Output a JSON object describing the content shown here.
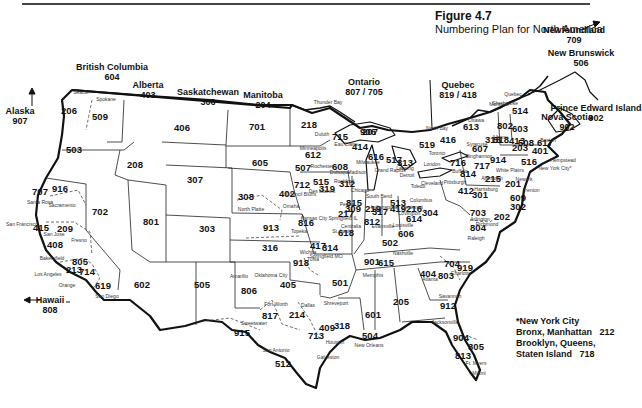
{
  "figure": {
    "title": "Figure 4.7",
    "subtitle": "Numbering Plan for North America"
  },
  "regions": [
    {
      "name": "Alaska",
      "code": "907",
      "x": 20,
      "y": 116
    },
    {
      "name": "British Columbia",
      "code": "604",
      "x": 112,
      "y": 72
    },
    {
      "name": "Alberta",
      "code": "403",
      "x": 148,
      "y": 90
    },
    {
      "name": "Saskatchewan",
      "code": "306",
      "x": 208,
      "y": 97
    },
    {
      "name": "Manitoba",
      "code": "204",
      "x": 263,
      "y": 100
    },
    {
      "name": "Ontario",
      "code": "807 / 705",
      "x": 364,
      "y": 87
    },
    {
      "name": "Quebec",
      "code": "819 / 418",
      "x": 458,
      "y": 90
    },
    {
      "name": "Newfoundland",
      "code": "709",
      "x": 574,
      "y": 35
    },
    {
      "name": "New Brunswick",
      "code": "506",
      "x": 581,
      "y": 58
    },
    {
      "name": "Nova Scotia",
      "code": "902",
      "x": 567,
      "y": 122
    },
    {
      "name": "Prince Edward Island",
      "code": "902",
      "x": 596,
      "y": 113
    },
    {
      "name": "Hawaii",
      "code": "808",
      "x": 50,
      "y": 305
    }
  ],
  "area_codes": [
    {
      "code": "206",
      "x": 69,
      "y": 111
    },
    {
      "code": "509",
      "x": 100,
      "y": 117
    },
    {
      "code": "503",
      "x": 74,
      "y": 150
    },
    {
      "code": "208",
      "x": 135,
      "y": 165
    },
    {
      "code": "406",
      "x": 182,
      "y": 128
    },
    {
      "code": "307",
      "x": 195,
      "y": 180
    },
    {
      "code": "701",
      "x": 257,
      "y": 127
    },
    {
      "code": "605",
      "x": 260,
      "y": 163
    },
    {
      "code": "218",
      "x": 309,
      "y": 125
    },
    {
      "code": "707",
      "x": 40,
      "y": 192
    },
    {
      "code": "916",
      "x": 60,
      "y": 189
    },
    {
      "code": "702",
      "x": 100,
      "y": 212
    },
    {
      "code": "801",
      "x": 151,
      "y": 222
    },
    {
      "code": "303",
      "x": 207,
      "y": 229
    },
    {
      "code": "308",
      "x": 246,
      "y": 197
    },
    {
      "code": "402",
      "x": 287,
      "y": 194
    },
    {
      "code": "712",
      "x": 302,
      "y": 185
    },
    {
      "code": "515",
      "x": 321,
      "y": 182
    },
    {
      "code": "612",
      "x": 313,
      "y": 155
    },
    {
      "code": "507",
      "x": 303,
      "y": 168
    },
    {
      "code": "715",
      "x": 340,
      "y": 137
    },
    {
      "code": "906",
      "x": 368,
      "y": 132
    },
    {
      "code": "414",
      "x": 360,
      "y": 147
    },
    {
      "code": "608",
      "x": 340,
      "y": 167
    },
    {
      "code": "616",
      "x": 376,
      "y": 157
    },
    {
      "code": "517",
      "x": 394,
      "y": 160
    },
    {
      "code": "313",
      "x": 405,
      "y": 163
    },
    {
      "code": "519",
      "x": 427,
      "y": 145
    },
    {
      "code": "416",
      "x": 448,
      "y": 140
    },
    {
      "code": "613",
      "x": 471,
      "y": 127
    },
    {
      "code": "514",
      "x": 520,
      "y": 111
    },
    {
      "code": "207",
      "x": 370,
      "y": 132
    },
    {
      "code": "315",
      "x": 493,
      "y": 140
    },
    {
      "code": "518",
      "x": 501,
      "y": 140
    },
    {
      "code": "802",
      "x": 505,
      "y": 126
    },
    {
      "code": "603",
      "x": 520,
      "y": 129
    },
    {
      "code": "413",
      "x": 517,
      "y": 141
    },
    {
      "code": "617",
      "x": 545,
      "y": 143
    },
    {
      "code": "508",
      "x": 526,
      "y": 143
    },
    {
      "code": "203",
      "x": 520,
      "y": 148
    },
    {
      "code": "401",
      "x": 540,
      "y": 151
    },
    {
      "code": "716",
      "x": 458,
      "y": 163
    },
    {
      "code": "607",
      "x": 480,
      "y": 149
    },
    {
      "code": "717",
      "x": 482,
      "y": 166
    },
    {
      "code": "914",
      "x": 498,
      "y": 160
    },
    {
      "code": "814",
      "x": 468,
      "y": 174
    },
    {
      "code": "215",
      "x": 493,
      "y": 179
    },
    {
      "code": "201",
      "x": 513,
      "y": 184
    },
    {
      "code": "516",
      "x": 529,
      "y": 162
    },
    {
      "code": "312",
      "x": 347,
      "y": 184
    },
    {
      "code": "319",
      "x": 327,
      "y": 189
    },
    {
      "code": "815",
      "x": 354,
      "y": 203
    },
    {
      "code": "309",
      "x": 353,
      "y": 209
    },
    {
      "code": "219",
      "x": 373,
      "y": 209
    },
    {
      "code": "419",
      "x": 398,
      "y": 209
    },
    {
      "code": "216",
      "x": 414,
      "y": 209
    },
    {
      "code": "412",
      "x": 466,
      "y": 191
    },
    {
      "code": "301",
      "x": 480,
      "y": 195
    },
    {
      "code": "609",
      "x": 518,
      "y": 198
    },
    {
      "code": "302",
      "x": 518,
      "y": 207
    },
    {
      "code": "202",
      "x": 502,
      "y": 217
    },
    {
      "code": "304",
      "x": 430,
      "y": 213
    },
    {
      "code": "703",
      "x": 478,
      "y": 213
    },
    {
      "code": "804",
      "x": 478,
      "y": 228
    },
    {
      "code": "317",
      "x": 380,
      "y": 212
    },
    {
      "code": "513",
      "x": 398,
      "y": 203
    },
    {
      "code": "614",
      "x": 414,
      "y": 219
    },
    {
      "code": "217",
      "x": 346,
      "y": 214
    },
    {
      "code": "812",
      "x": 372,
      "y": 222
    },
    {
      "code": "606",
      "x": 406,
      "y": 234
    },
    {
      "code": "502",
      "x": 390,
      "y": 243
    },
    {
      "code": "618",
      "x": 346,
      "y": 233
    },
    {
      "code": "314",
      "x": 330,
      "y": 248
    },
    {
      "code": "816",
      "x": 306,
      "y": 223
    },
    {
      "code": "913",
      "x": 271,
      "y": 228
    },
    {
      "code": "316",
      "x": 270,
      "y": 248
    },
    {
      "code": "417",
      "x": 318,
      "y": 246
    },
    {
      "code": "615",
      "x": 386,
      "y": 263
    },
    {
      "code": "901",
      "x": 372,
      "y": 262
    },
    {
      "code": "704",
      "x": 452,
      "y": 264
    },
    {
      "code": "919",
      "x": 465,
      "y": 268
    },
    {
      "code": "404",
      "x": 428,
      "y": 274
    },
    {
      "code": "803",
      "x": 446,
      "y": 276
    },
    {
      "code": "501",
      "x": 340,
      "y": 283
    },
    {
      "code": "205",
      "x": 401,
      "y": 302
    },
    {
      "code": "601",
      "x": 373,
      "y": 315
    },
    {
      "code": "912",
      "x": 448,
      "y": 306
    },
    {
      "code": "904",
      "x": 461,
      "y": 338
    },
    {
      "code": "305",
      "x": 476,
      "y": 347
    },
    {
      "code": "813",
      "x": 463,
      "y": 356
    },
    {
      "code": "602",
      "x": 142,
      "y": 285
    },
    {
      "code": "505",
      "x": 202,
      "y": 285
    },
    {
      "code": "806",
      "x": 249,
      "y": 291
    },
    {
      "code": "918",
      "x": 301,
      "y": 263
    },
    {
      "code": "405",
      "x": 288,
      "y": 285
    },
    {
      "code": "817",
      "x": 270,
      "y": 316
    },
    {
      "code": "214",
      "x": 297,
      "y": 315
    },
    {
      "code": "915",
      "x": 242,
      "y": 333
    },
    {
      "code": "409",
      "x": 327,
      "y": 328
    },
    {
      "code": "713",
      "x": 316,
      "y": 336
    },
    {
      "code": "318",
      "x": 342,
      "y": 326
    },
    {
      "code": "504",
      "x": 370,
      "y": 336
    },
    {
      "code": "512",
      "x": 283,
      "y": 364
    },
    {
      "code": "415",
      "x": 41,
      "y": 228
    },
    {
      "code": "209",
      "x": 65,
      "y": 229
    },
    {
      "code": "408",
      "x": 55,
      "y": 245
    },
    {
      "code": "805",
      "x": 80,
      "y": 262
    },
    {
      "code": "213",
      "x": 74,
      "y": 270
    },
    {
      "code": "714",
      "x": 87,
      "y": 272
    },
    {
      "code": "619",
      "x": 103,
      "y": 286
    }
  ],
  "cities": [
    {
      "name": "Seattle",
      "x": 81,
      "y": 92
    },
    {
      "name": "Spokane",
      "x": 106,
      "y": 99
    },
    {
      "name": "Thunder Bay",
      "x": 328,
      "y": 102
    },
    {
      "name": "North Bay",
      "x": 437,
      "y": 128
    },
    {
      "name": "Montreal",
      "x": 499,
      "y": 104
    },
    {
      "name": "Quebec",
      "x": 513,
      "y": 94
    },
    {
      "name": "Sherbrooke",
      "x": 505,
      "y": 103
    },
    {
      "name": "Ottawa",
      "x": 476,
      "y": 120
    },
    {
      "name": "Duluth",
      "x": 322,
      "y": 134
    },
    {
      "name": "Minneapolis",
      "x": 313,
      "y": 148
    },
    {
      "name": "Eau Claire",
      "x": 346,
      "y": 144
    },
    {
      "name": "Rochester",
      "x": 322,
      "y": 166
    },
    {
      "name": "Dubuque",
      "x": 340,
      "y": 172
    },
    {
      "name": "Milwaukee",
      "x": 368,
      "y": 162
    },
    {
      "name": "Madison",
      "x": 357,
      "y": 172
    },
    {
      "name": "Rockford",
      "x": 344,
      "y": 181
    },
    {
      "name": "Chicago",
      "x": 360,
      "y": 190
    },
    {
      "name": "Grand Rapids",
      "x": 390,
      "y": 170
    },
    {
      "name": "Lansing",
      "x": 405,
      "y": 168
    },
    {
      "name": "Detroit",
      "x": 407,
      "y": 175
    },
    {
      "name": "Toronto",
      "x": 437,
      "y": 153
    },
    {
      "name": "London",
      "x": 432,
      "y": 164
    },
    {
      "name": "Buffalo",
      "x": 460,
      "y": 171
    },
    {
      "name": "Binghamton",
      "x": 479,
      "y": 156
    },
    {
      "name": "Syracuse",
      "x": 477,
      "y": 144
    },
    {
      "name": "Albany",
      "x": 500,
      "y": 137
    },
    {
      "name": "Boston",
      "x": 548,
      "y": 140
    },
    {
      "name": "Hempstead",
      "x": 563,
      "y": 160
    },
    {
      "name": "New York City*",
      "x": 555,
      "y": 168
    },
    {
      "name": "Newark",
      "x": 524,
      "y": 179
    },
    {
      "name": "Trenton",
      "x": 531,
      "y": 190
    },
    {
      "name": "White Plains",
      "x": 510,
      "y": 170
    },
    {
      "name": "Allentown",
      "x": 492,
      "y": 178
    },
    {
      "name": "Harrisburg",
      "x": 486,
      "y": 189
    },
    {
      "name": "Pittsburgh",
      "x": 455,
      "y": 182
    },
    {
      "name": "Cleveland",
      "x": 432,
      "y": 183
    },
    {
      "name": "Toledo",
      "x": 418,
      "y": 186
    },
    {
      "name": "Columbus",
      "x": 421,
      "y": 200
    },
    {
      "name": "Cincinnati",
      "x": 412,
      "y": 207
    },
    {
      "name": "Covington",
      "x": 409,
      "y": 213
    },
    {
      "name": "South Bend",
      "x": 379,
      "y": 196
    },
    {
      "name": "Indianapolis",
      "x": 384,
      "y": 207
    },
    {
      "name": "Louisville",
      "x": 403,
      "y": 225
    },
    {
      "name": "Evansville",
      "x": 383,
      "y": 226
    },
    {
      "name": "Peoria",
      "x": 347,
      "y": 204
    },
    {
      "name": "Springfield IL",
      "x": 343,
      "y": 218
    },
    {
      "name": "Centralia",
      "x": 351,
      "y": 226
    },
    {
      "name": "St. Louis",
      "x": 342,
      "y": 231
    },
    {
      "name": "Arlington",
      "x": 480,
      "y": 219
    },
    {
      "name": "Richmond",
      "x": 487,
      "y": 224
    },
    {
      "name": "Raleigh",
      "x": 476,
      "y": 238
    },
    {
      "name": "Charlotte",
      "x": 461,
      "y": 273
    },
    {
      "name": "Nashville",
      "x": 403,
      "y": 253
    },
    {
      "name": "Memphis",
      "x": 373,
      "y": 275
    },
    {
      "name": "Atlanta",
      "x": 430,
      "y": 279
    },
    {
      "name": "Savannah",
      "x": 450,
      "y": 296
    },
    {
      "name": "Jacksonville",
      "x": 445,
      "y": 322
    },
    {
      "name": "Ft. Myers",
      "x": 476,
      "y": 363
    },
    {
      "name": "Miami",
      "x": 479,
      "y": 373
    },
    {
      "name": "Des Moines",
      "x": 322,
      "y": 191
    },
    {
      "name": "Council Bluffs",
      "x": 301,
      "y": 194
    },
    {
      "name": "Omaha",
      "x": 291,
      "y": 206
    },
    {
      "name": "Kansas City",
      "x": 314,
      "y": 218
    },
    {
      "name": "Springfield MO",
      "x": 326,
      "y": 256
    },
    {
      "name": "Topeka",
      "x": 299,
      "y": 231
    },
    {
      "name": "Wichita",
      "x": 308,
      "y": 252
    },
    {
      "name": "North Platte",
      "x": 251,
      "y": 209
    },
    {
      "name": "Tulsa",
      "x": 313,
      "y": 259
    },
    {
      "name": "Oklahoma City",
      "x": 271,
      "y": 275
    },
    {
      "name": "Amarillo",
      "x": 239,
      "y": 276
    },
    {
      "name": "Fort Worth",
      "x": 276,
      "y": 304
    },
    {
      "name": "Dallas",
      "x": 308,
      "y": 305
    },
    {
      "name": "Shreveport",
      "x": 336,
      "y": 303
    },
    {
      "name": "Sweetwater",
      "x": 254,
      "y": 323
    },
    {
      "name": "San Antonio",
      "x": 276,
      "y": 350
    },
    {
      "name": "Houston",
      "x": 335,
      "y": 342
    },
    {
      "name": "Galveston",
      "x": 328,
      "y": 357
    },
    {
      "name": "New Orleans",
      "x": 369,
      "y": 345
    },
    {
      "name": "Santa Rosa",
      "x": 40,
      "y": 202
    },
    {
      "name": "Sacramento",
      "x": 62,
      "y": 205
    },
    {
      "name": "San Francisco",
      "x": 22,
      "y": 224
    },
    {
      "name": "San Jose",
      "x": 54,
      "y": 234
    },
    {
      "name": "Fresno",
      "x": 79,
      "y": 240
    },
    {
      "name": "Bakersfield",
      "x": 52,
      "y": 258
    },
    {
      "name": "Los Angeles",
      "x": 48,
      "y": 274
    },
    {
      "name": "Orange",
      "x": 67,
      "y": 285
    },
    {
      "name": "San Diego",
      "x": 107,
      "y": 296
    }
  ],
  "footnote": {
    "line1": "*New York City",
    "line2": "Bronx, Manhattan   212",
    "line3": "Brooklyn, Queens,",
    "line4": "Staten Island   718"
  }
}
